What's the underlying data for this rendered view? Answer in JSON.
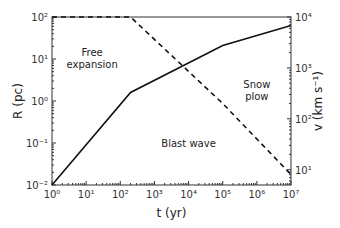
{
  "chart_data": {
    "type": "line",
    "xlabel": "t (yr)",
    "ylabel": "R (pc)",
    "y2label": "v (km s⁻¹)",
    "xscale": "log",
    "yscale": "log",
    "y2scale": "log",
    "xlim": [
      1,
      10000000
    ],
    "ylim": [
      0.01,
      100
    ],
    "y2lim": [
      5,
      10000
    ],
    "xticks": [
      "10⁰",
      "10¹",
      "10²",
      "10³",
      "10⁴",
      "10⁵",
      "10⁶",
      "10⁷"
    ],
    "yticks": [
      "10⁻²",
      "10⁻¹",
      "10⁰",
      "10¹",
      "10²"
    ],
    "y2ticks": [
      "10¹",
      "10²",
      "10³",
      "10⁴"
    ],
    "series": [
      {
        "name": "R",
        "axis": "left",
        "style": "solid",
        "x": [
          1,
          200,
          100000,
          10000000
        ],
        "y": [
          0.01,
          1.6,
          21,
          63
        ]
      },
      {
        "name": "v",
        "axis": "right",
        "style": "dashed",
        "x": [
          1,
          200,
          100000,
          10000000
        ],
        "y": [
          10000,
          10000,
          200,
          8
        ]
      }
    ],
    "annotations": [
      {
        "text": [
          "Free",
          "expansion"
        ],
        "x": 15,
        "y": 12
      },
      {
        "text": [
          "Blast wave"
        ],
        "x": 10000,
        "y": 0.08
      },
      {
        "text": [
          "Snow",
          "plow"
        ],
        "x": 1000000,
        "y": 2
      }
    ]
  }
}
